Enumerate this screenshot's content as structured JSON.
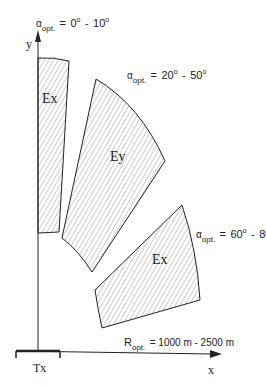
{
  "diagram": {
    "axes": {
      "x_label": "x",
      "y_label": "y",
      "origin_label": "Tx"
    },
    "regions": [
      {
        "label": "Ex",
        "alpha_label": "α",
        "alpha_sub": "opt.",
        "range_from": "0",
        "range_to": "10",
        "degree": "o"
      },
      {
        "label": "Ey",
        "alpha_label": "α",
        "alpha_sub": "opt.",
        "range_from": "20",
        "range_to": "50",
        "degree": "o"
      },
      {
        "label": "Ex",
        "alpha_label": "α",
        "alpha_sub": "opt.",
        "range_from": "60",
        "range_to": "80",
        "degree": "o"
      }
    ],
    "range": {
      "symbol": "R",
      "sub": "opt.",
      "text": "= 1000 m - 2500 m"
    },
    "colors": {
      "line": "#222222",
      "hatch": "#9a9a9a",
      "background": "#ffffff"
    }
  }
}
